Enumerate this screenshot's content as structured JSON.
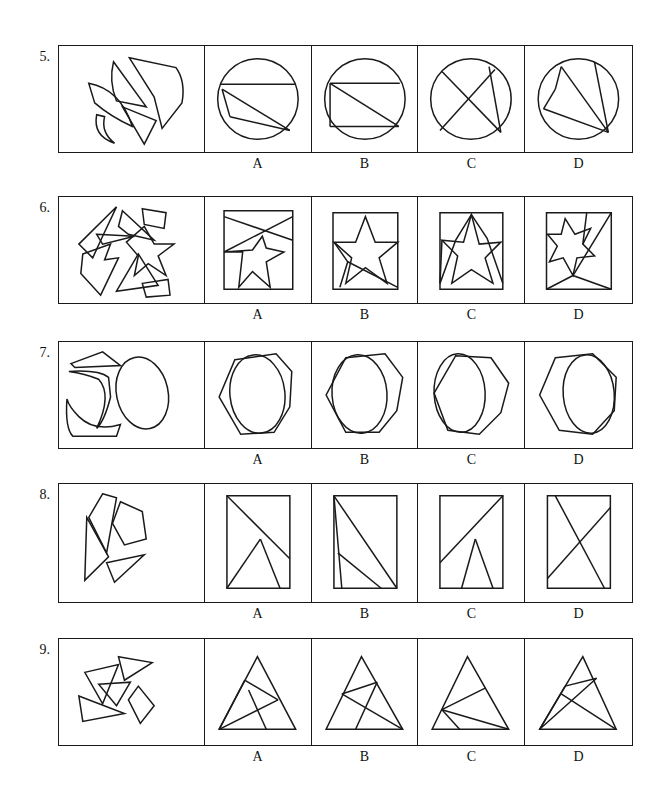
{
  "page": {
    "type": "spatial-reasoning-test",
    "width": 668,
    "height": 790,
    "ink_color": "#1a1a1a",
    "background": "#ffffff"
  },
  "option_labels": [
    "A",
    "B",
    "C",
    "D"
  ],
  "rows": [
    {
      "number": "5.",
      "top": 45,
      "height": 108,
      "label_y": 156,
      "prompt_shapes": "four curved and angular fragments of a circle",
      "options": [
        {
          "label": "A",
          "figure": "circle with chord and inscribed triangle"
        },
        {
          "label": "B",
          "figure": "circle with inscribed rectangle and diagonal"
        },
        {
          "label": "C",
          "figure": "circle with two crossing chords forming X"
        },
        {
          "label": "D",
          "figure": "circle with fan of chords from lower right point"
        }
      ]
    },
    {
      "number": "6.",
      "top": 196,
      "height": 108,
      "label_y": 307,
      "prompt_shapes": "star fragments, quadrilaterals and thin slivers",
      "options": [
        {
          "label": "A",
          "figure": "square with large star and crossing diagonal"
        },
        {
          "label": "B",
          "figure": "square with centered star and lower chord"
        },
        {
          "label": "C",
          "figure": "square with tall star and side wedges"
        },
        {
          "label": "D",
          "figure": "square with small star and long diagonal"
        }
      ]
    },
    {
      "number": "7.",
      "top": 341,
      "height": 108,
      "label_y": 452,
      "prompt_shapes": "ellipse plus curved crescent and angular arcs",
      "options": [
        {
          "label": "A",
          "figure": "heptagon overlapping centered ellipse"
        },
        {
          "label": "B",
          "figure": "heptagon with ellipse shifted left"
        },
        {
          "label": "C",
          "figure": "heptagon with ellipse on left edge"
        },
        {
          "label": "D",
          "figure": "heptagon with ellipse shifted right"
        }
      ]
    },
    {
      "number": "8.",
      "top": 483,
      "height": 120,
      "label_y": 606,
      "prompt_shapes": "triangles and a pentagon scattered",
      "options": [
        {
          "label": "A",
          "figure": "rectangle with diagonal and inner triangle"
        },
        {
          "label": "B",
          "figure": "rectangle with steep line and diagonal"
        },
        {
          "label": "C",
          "figure": "rectangle with rising diagonal and V"
        },
        {
          "label": "D",
          "figure": "rectangle with crossing diagonals"
        }
      ]
    },
    {
      "number": "9.",
      "top": 638,
      "height": 108,
      "label_y": 749,
      "prompt_shapes": "small triangles and a quadrilateral scattered",
      "options": [
        {
          "label": "A",
          "figure": "triangle with inner fan from left vertex"
        },
        {
          "label": "B",
          "figure": "triangle with lines to right vertex"
        },
        {
          "label": "C",
          "figure": "triangle with lines to lower right vertex"
        },
        {
          "label": "D",
          "figure": "triangle with narrow fan from left vertex"
        }
      ]
    }
  ],
  "layout": {
    "grid_left": 58,
    "grid_right": 633,
    "prompt_cell_width": 146,
    "option_cell_width": 107
  }
}
